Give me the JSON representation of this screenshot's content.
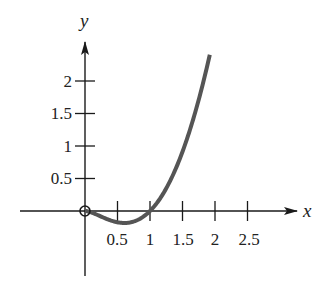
{
  "chart_data": {
    "type": "line",
    "title": "",
    "xlabel": "x",
    "ylabel": "y",
    "function": "y = x^2 ln(x)",
    "xlim": [
      -1.0,
      3.3
    ],
    "ylim": [
      -1.0,
      2.9
    ],
    "x_ticks": [
      0.5,
      1,
      1.5,
      2,
      2.5
    ],
    "x_tick_labels": [
      "0.5",
      "1",
      "1.5",
      "2",
      "2.5"
    ],
    "y_ticks": [
      0.5,
      1,
      1.5,
      2
    ],
    "y_tick_labels": [
      "0.5",
      "1",
      "1.5",
      "2"
    ],
    "grid": false,
    "legend": null,
    "series": [
      {
        "name": "f(x)",
        "color": "#555555",
        "x": [
          0,
          0.2,
          0.4,
          0.607,
          0.8,
          1.0,
          1.2,
          1.4,
          1.5,
          1.6,
          1.8,
          1.92
        ],
        "y": [
          0,
          -0.064,
          -0.147,
          -0.184,
          -0.143,
          0,
          0.263,
          0.66,
          0.91,
          1.2,
          1.9,
          2.4
        ]
      }
    ],
    "annotations": [
      {
        "type": "open-circle",
        "x": 0,
        "y": 0
      }
    ]
  },
  "axes": {
    "x_label": "x",
    "y_label": "y",
    "x_tick_labels": [
      "0.5",
      "1",
      "1.5",
      "2",
      "2.5"
    ],
    "y_tick_labels": [
      "0.5",
      "1",
      "1.5",
      "2"
    ],
    "curve_color": "#555555",
    "axis_color": "#1a1a1a"
  }
}
